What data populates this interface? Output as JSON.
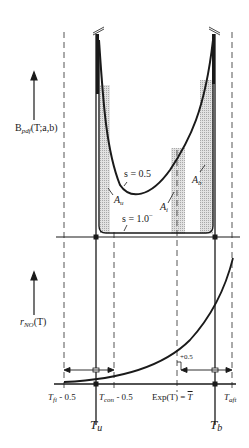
{
  "figure": {
    "type": "schematic",
    "top_panel": {
      "y_axis_label": {
        "main": "B",
        "sub": "pdf",
        "args": "(T;a,b)"
      },
      "curves": [
        {
          "name": "s = 0.5",
          "label": "s = 0.5"
        },
        {
          "name": "s = 1.0-",
          "label": "s = 1.0",
          "sup": "−"
        }
      ],
      "areas": [
        {
          "id": "A_u",
          "main": "A",
          "sub": "u"
        },
        {
          "id": "A_i",
          "main": "A",
          "sub": "i"
        },
        {
          "id": "A_b",
          "main": "A",
          "sub": "b"
        }
      ]
    },
    "bottom_panel": {
      "y_axis_label": {
        "main": "r",
        "sub": "NO",
        "args": "(T)"
      },
      "offset_label": "+0.5"
    },
    "x_labels": {
      "t_fi": {
        "main": "T",
        "sub": "fi",
        "suffix": " - 0.5"
      },
      "t_con": {
        "main": "T",
        "sub": "con",
        "suffix": " - 0.5"
      },
      "exp": {
        "text": "Exp(T) = ",
        "tbar": "T"
      },
      "t_aft": {
        "main": "T",
        "sub": "aft"
      },
      "t_u": {
        "main": "T",
        "sub": "u"
      },
      "t_b": {
        "main": "T",
        "sub": "b"
      }
    },
    "colors": {
      "ink": "#1a1a1a",
      "shade": "#d4d4d4",
      "dash": "#555555"
    }
  }
}
